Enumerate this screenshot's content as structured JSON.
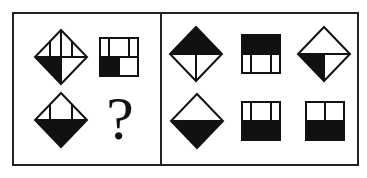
{
  "puzzle": {
    "type": "figure-reasoning",
    "question_panel": {
      "figures": [
        {
          "id": "q1",
          "shape": "diamond",
          "description": "diamond with horizontal midline, three vertical lines in top half, bottom-left quarter black"
        },
        {
          "id": "q2",
          "shape": "square",
          "description": "square with midline, top row split into three cells, bottom-left cell black"
        },
        {
          "id": "q3",
          "shape": "diamond",
          "description": "diamond with two vertical lines in top half, bottom half black"
        },
        {
          "id": "q4",
          "shape": "unknown",
          "label": "?"
        }
      ]
    },
    "options_panel": {
      "figures": [
        {
          "id": "A",
          "shape": "diamond",
          "description": "top half black, bottom half split by vertical line"
        },
        {
          "id": "B",
          "shape": "square",
          "description": "top half black, bottom row split into three cells"
        },
        {
          "id": "C",
          "shape": "diamond",
          "description": "bottom-left quarter black, bottom half split by vertical line"
        },
        {
          "id": "D",
          "shape": "diamond",
          "description": "bottom half black, top half plain"
        },
        {
          "id": "E",
          "shape": "square",
          "description": "top row split into three cells, bottom half black"
        },
        {
          "id": "F",
          "shape": "square",
          "description": "top row split into two cells, bottom half black"
        }
      ]
    },
    "colors": {
      "ink": "#111111",
      "background": "#ffffff",
      "frame": "#222222"
    }
  }
}
